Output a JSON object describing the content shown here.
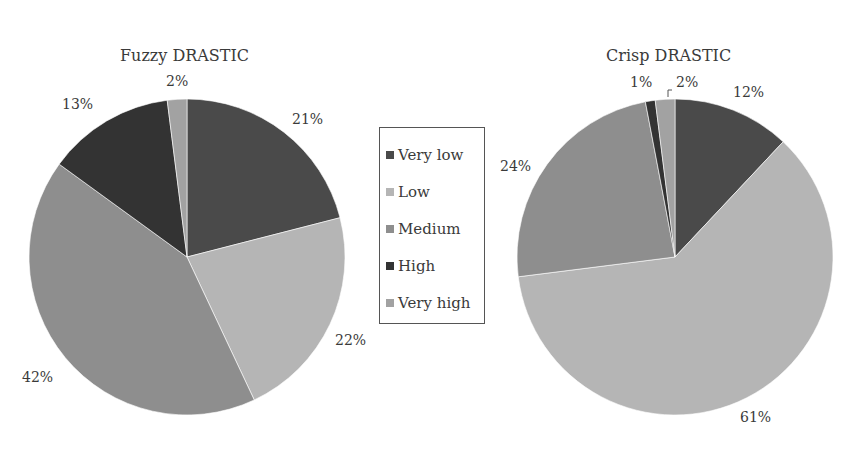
{
  "chart_data": [
    {
      "type": "pie",
      "title": "Fuzzy DRASTIC",
      "categories": [
        "Very low",
        "Low",
        "Medium",
        "High",
        "Very high"
      ],
      "values": [
        21,
        22,
        42,
        13,
        2
      ],
      "labels": [
        "21%",
        "22%",
        "42%",
        "13%",
        "2%"
      ],
      "start_angle": "12 o'clock",
      "direction": "clockwise"
    },
    {
      "type": "pie",
      "title": "Crisp DRASTIC",
      "categories": [
        "Very low",
        "Low",
        "Medium",
        "High",
        "Very high"
      ],
      "values": [
        12,
        61,
        24,
        1,
        2
      ],
      "labels": [
        "12%",
        "61%",
        "24%",
        "1%",
        "2%"
      ],
      "start_angle": "12 o'clock",
      "direction": "clockwise"
    }
  ],
  "legend": {
    "position": "center, between charts",
    "items": [
      {
        "label": "Very low",
        "color": "#4a4a4a"
      },
      {
        "label": "Low",
        "color": "#b5b5b5"
      },
      {
        "label": "Medium",
        "color": "#8e8e8e"
      },
      {
        "label": "High",
        "color": "#333333"
      },
      {
        "label": "Very high",
        "color": "#a2a2a2"
      }
    ]
  },
  "charts": {
    "left": {
      "title": "Fuzzy DRASTIC",
      "labels": {
        "very_low": "21%",
        "low": "22%",
        "medium": "42%",
        "high": "13%",
        "very_high": "2%"
      }
    },
    "right": {
      "title": "Crisp DRASTIC",
      "labels": {
        "very_low": "12%",
        "low": "61%",
        "medium": "24%",
        "high": "1%",
        "very_high": "2%"
      }
    }
  }
}
